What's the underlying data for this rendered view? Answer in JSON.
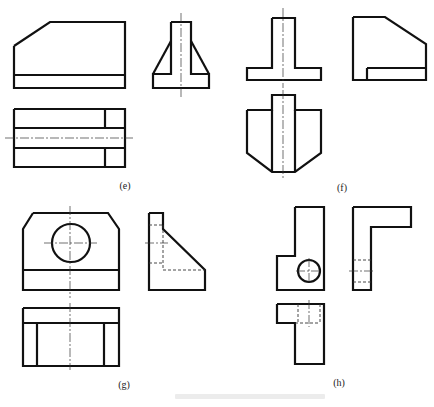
{
  "figure": {
    "colors": {
      "line": "#111111",
      "background": "#ffffff"
    },
    "panels": [
      {
        "id": "e",
        "label": "(e)",
        "label_pos": [
          125,
          188
        ],
        "views": [
          {
            "name": "front-view",
            "outlines": [
              [
                [
                  14,
                  46
                ],
                [
                  50,
                  22
                ],
                [
                  125,
                  22
                ],
                [
                  125,
                  88
                ],
                [
                  14,
                  88
                ],
                [
                  14,
                  46
                ]
              ]
            ],
            "lines": [
              [
                14,
                75,
                125,
                75
              ]
            ],
            "hidden": [],
            "center": [],
            "circles": []
          },
          {
            "name": "side-view",
            "outlines": [
              [
                [
                  171,
                  22
                ],
                [
                  191,
                  22
                ],
                [
                  191,
                  74
                ],
                [
                  209,
                  74
                ],
                [
                  209,
                  88
                ],
                [
                  153,
                  88
                ],
                [
                  153,
                  74
                ],
                [
                  171,
                  74
                ],
                [
                  171,
                  22
                ]
              ]
            ],
            "lines": [
              [
                171,
                41,
                153,
                74
              ],
              [
                191,
                41,
                209,
                74
              ]
            ],
            "hidden": [],
            "center": [
              [
                181,
                13,
                181,
                98
              ]
            ],
            "circles": []
          },
          {
            "name": "top-view",
            "outlines": [
              [
                [
                  14,
                  109
                ],
                [
                  125,
                  109
                ],
                [
                  125,
                  167
                ],
                [
                  14,
                  167
                ],
                [
                  14,
                  109
                ]
              ]
            ],
            "lines": [
              [
                14,
                128,
                125,
                128
              ],
              [
                14,
                148,
                125,
                148
              ],
              [
                105,
                109,
                105,
                128
              ],
              [
                105,
                148,
                105,
                167
              ]
            ],
            "hidden": [],
            "center": [
              [
                5,
                138,
                133,
                138
              ]
            ],
            "circles": []
          }
        ]
      },
      {
        "id": "f",
        "label": "(f)",
        "label_pos": [
          342,
          190
        ],
        "views": [
          {
            "name": "front-view",
            "outlines": [
              [
                [
                  272,
                  18
                ],
                [
                  295,
                  18
                ],
                [
                  295,
                  68
                ],
                [
                  321,
                  68
                ],
                [
                  321,
                  80
                ],
                [
                  247,
                  80
                ],
                [
                  247,
                  68
                ],
                [
                  272,
                  68
                ],
                [
                  272,
                  18
                ]
              ]
            ],
            "lines": [],
            "hidden": [],
            "center": [
              [
                283,
                8,
                283,
                88
              ]
            ],
            "circles": []
          },
          {
            "name": "side-view",
            "outlines": [
              [
                [
                  353,
                  17
                ],
                [
                  385,
                  17
                ],
                [
                  426,
                  44
                ],
                [
                  426,
                  80
                ],
                [
                  353,
                  80
                ],
                [
                  353,
                  17
                ]
              ]
            ],
            "lines": [
              [
                367,
                68,
                426,
                68
              ],
              [
                367,
                68,
                367,
                80
              ]
            ],
            "hidden": [],
            "center": [],
            "circles": []
          },
          {
            "name": "top-view",
            "outlines": [
              [
                [
                  247,
                  110
                ],
                [
                  272,
                  110
                ],
                [
                  272,
                  95
                ],
                [
                  295,
                  95
                ],
                [
                  295,
                  110
                ],
                [
                  321,
                  110
                ],
                [
                  321,
                  153
                ],
                [
                  295,
                  172
                ],
                [
                  272,
                  172
                ],
                [
                  247,
                  153
                ],
                [
                  247,
                  110
                ]
              ]
            ],
            "lines": [
              [
                272,
                110,
                272,
                172
              ],
              [
                295,
                110,
                295,
                172
              ]
            ],
            "hidden": [],
            "center": [
              [
                283,
                90,
                283,
                178
              ]
            ],
            "circles": []
          }
        ]
      },
      {
        "id": "g",
        "label": "(g)",
        "label_pos": [
          124,
          387
        ],
        "views": [
          {
            "name": "front-view",
            "outlines": [
              [
                [
                  33,
                  213
                ],
                [
                  108,
                  213
                ],
                [
                  119,
                  229
                ],
                [
                  119,
                  290
                ],
                [
                  23,
                  290
                ],
                [
                  23,
                  229
                ],
                [
                  33,
                  213
                ]
              ]
            ],
            "lines": [
              [
                23,
                270,
                119,
                270
              ]
            ],
            "hidden": [],
            "center": [
              [
                70,
                206,
                70,
                298
              ],
              [
                44,
                243,
                97,
                243
              ]
            ],
            "circles": [
              [
                71,
                243,
                19
              ]
            ]
          },
          {
            "name": "side-view",
            "outlines": [
              [
                [
                  149,
                  213
                ],
                [
                  163,
                  213
                ],
                [
                  163,
                  229
                ],
                [
                  205,
                  270
                ],
                [
                  205,
                  290
                ],
                [
                  149,
                  290
                ],
                [
                  149,
                  213
                ]
              ]
            ],
            "lines": [],
            "hidden": [
              [
                149,
                225,
                163,
                225
              ],
              [
                149,
                263,
                163,
                263
              ],
              [
                163,
                225,
                163,
                270
              ],
              [
                163,
                270,
                205,
                270
              ]
            ],
            "center": [
              [
                145,
                243,
                168,
                243
              ]
            ],
            "circles": []
          },
          {
            "name": "top-view",
            "outlines": [
              [
                [
                  23,
                  308
                ],
                [
                  119,
                  308
                ],
                [
                  119,
                  366
                ],
                [
                  23,
                  366
                ],
                [
                  23,
                  308
                ]
              ]
            ],
            "lines": [
              [
                23,
                323,
                119,
                323
              ],
              [
                37,
                323,
                37,
                366
              ],
              [
                104,
                323,
                104,
                366
              ]
            ],
            "hidden": [],
            "center": [
              [
                70,
                303,
                70,
                370
              ]
            ],
            "circles": []
          }
        ]
      },
      {
        "id": "h",
        "label": "(h)",
        "label_pos": [
          339,
          385
        ],
        "views": [
          {
            "name": "front-view",
            "outlines": [
              [
                [
                  295,
                  207
                ],
                [
                  324,
                  207
                ],
                [
                  324,
                  290
                ],
                [
                  277,
                  290
                ],
                [
                  277,
                  256
                ],
                [
                  295,
                  256
                ],
                [
                  295,
                  207
                ]
              ]
            ],
            "lines": [],
            "hidden": [],
            "center": [
              [
                296,
                271,
                322,
                271
              ],
              [
                309,
                258,
                309,
                284
              ]
            ],
            "circles": [
              [
                309,
                271,
                11
              ]
            ]
          },
          {
            "name": "side-view",
            "outlines": [
              [
                [
                  353,
                  207
                ],
                [
                  411,
                  207
                ],
                [
                  411,
                  227
                ],
                [
                  371,
                  227
                ],
                [
                  371,
                  290
                ],
                [
                  353,
                  290
                ],
                [
                  353,
                  207
                ]
              ]
            ],
            "lines": [],
            "hidden": [
              [
                353,
                260,
                371,
                260
              ],
              [
                353,
                282,
                371,
                282
              ]
            ],
            "center": [
              [
                349,
                271,
                375,
                271
              ]
            ],
            "circles": []
          },
          {
            "name": "top-view",
            "outlines": [
              [
                [
                  277,
                  304
                ],
                [
                  324,
                  304
                ],
                [
                  324,
                  364
                ],
                [
                  295,
                  364
                ],
                [
                  295,
                  323
                ],
                [
                  277,
                  323
                ],
                [
                  277,
                  304
                ]
              ]
            ],
            "lines": [],
            "hidden": [
              [
                298,
                304,
                298,
                323
              ],
              [
                320,
                304,
                320,
                323
              ],
              [
                295,
                323,
                320,
                323
              ]
            ],
            "center": [
              [
                309,
                300,
                309,
                327
              ]
            ],
            "circles": []
          }
        ]
      }
    ],
    "caption": ""
  }
}
